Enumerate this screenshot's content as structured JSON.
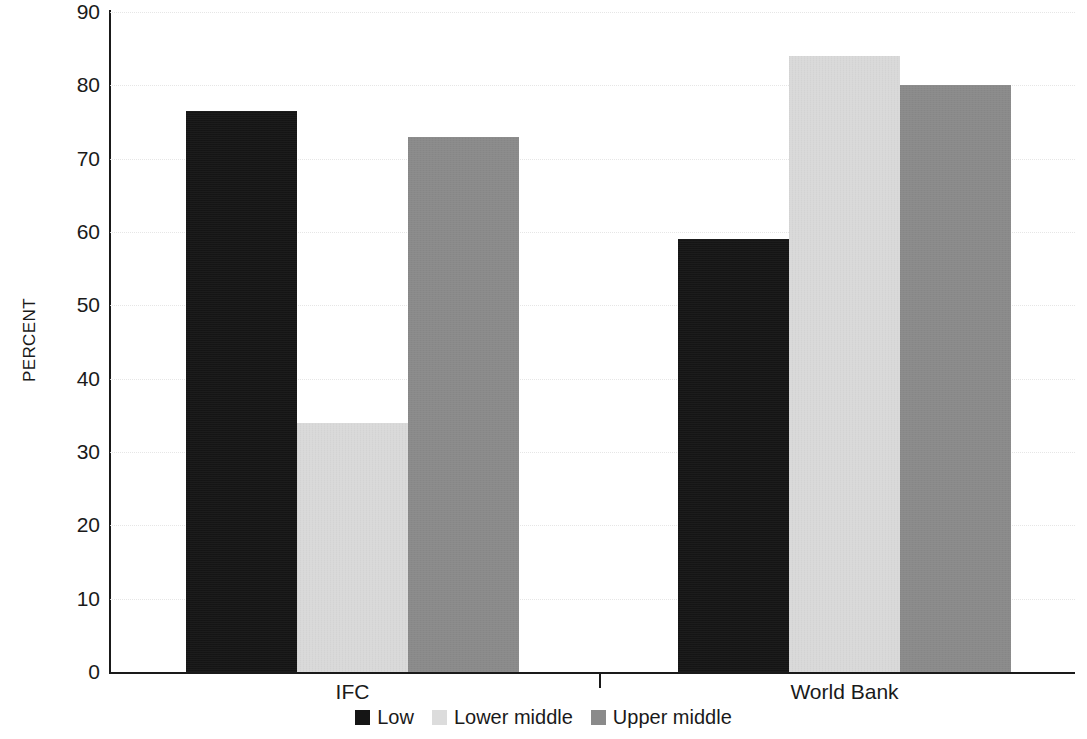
{
  "chart_data": {
    "type": "bar",
    "title": "",
    "subtitle": "",
    "xlabel": "",
    "ylabel": "PERCENT",
    "categories": [
      "IFC",
      "World Bank"
    ],
    "series": [
      {
        "name": "Low",
        "color": "#151515",
        "values": [
          76.5,
          59
        ]
      },
      {
        "name": "Lower middle",
        "color": "#d9d9d9",
        "values": [
          34,
          84
        ]
      },
      {
        "name": "Upper middle",
        "color": "#8a8a8a",
        "values": [
          73,
          80
        ]
      }
    ],
    "ylim": [
      0,
      90
    ],
    "ytick_values": [
      0,
      10,
      20,
      30,
      40,
      50,
      60,
      70,
      80,
      90
    ],
    "ytick_labels": [
      "0",
      "10",
      "20",
      "30",
      "40",
      "50",
      "60",
      "70",
      "80",
      "90"
    ],
    "grid": true,
    "grid_axis": "y",
    "legend_position": "bottom",
    "legend_entries": [
      "Low",
      "Lower middle",
      "Upper middle"
    ],
    "annotations": []
  },
  "axis": {
    "y_title": "PERCENT"
  },
  "legend": {
    "items": [
      {
        "label": "Low"
      },
      {
        "label": "Lower middle"
      },
      {
        "label": "Upper middle"
      }
    ]
  }
}
